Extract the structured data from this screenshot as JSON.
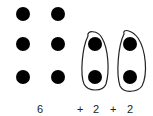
{
  "diagram": {
    "dot_color": "#000000",
    "grid_dots": [
      {
        "x": 23,
        "y": 14
      },
      {
        "x": 58,
        "y": 14
      },
      {
        "x": 23,
        "y": 44
      },
      {
        "x": 58,
        "y": 44
      },
      {
        "x": 23,
        "y": 77
      },
      {
        "x": 58,
        "y": 77
      }
    ],
    "groups": [
      {
        "dots": [
          {
            "x": 95,
            "y": 44
          },
          {
            "x": 95,
            "y": 77
          }
        ]
      },
      {
        "dots": [
          {
            "x": 130,
            "y": 44
          },
          {
            "x": 130,
            "y": 77
          }
        ]
      }
    ],
    "labels": {
      "six": "6",
      "plus1": "+",
      "two1": "2",
      "plus2": "+",
      "two2": "2"
    }
  }
}
